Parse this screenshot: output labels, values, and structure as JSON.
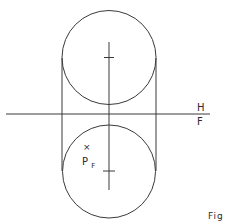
{
  "figure": {
    "labels": {
      "plane_top": "H",
      "plane_bottom": "F",
      "point_marker": "×",
      "point_name": "P",
      "point_subscript": "F",
      "caption": "Fig"
    },
    "stroke_color": "#3a3a3a",
    "background": "#ffffff"
  }
}
